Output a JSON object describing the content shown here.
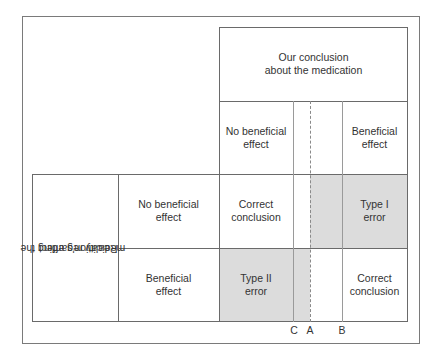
{
  "header": {
    "title_line1": "Our conclusion",
    "title_line2": "about the medication"
  },
  "columns": {
    "no_effect_line1": "No beneficial",
    "no_effect_line2": "effect",
    "effect_line1": "Beneficial",
    "effect_line2": "effect"
  },
  "rows": {
    "label_line1": "Reality regarding the",
    "label_line2": "medication's effect",
    "row1_line1": "No beneficial",
    "row1_line2": "effect",
    "row2_line1": "Beneficial",
    "row2_line2": "effect"
  },
  "cells": {
    "r1c1_line1": "Correct",
    "r1c1_line2": "conclusion",
    "r1c2_line1": "Type I",
    "r1c2_line2": "error",
    "r2c1_line1": "Type II",
    "r2c1_line2": "error",
    "r2c2_line1": "Correct",
    "r2c2_line2": "conclusion"
  },
  "markers": {
    "c": "C",
    "a": "A",
    "b": "B"
  },
  "colors": {
    "shade": "#dcdcdc",
    "line": "#6a6a6a"
  }
}
